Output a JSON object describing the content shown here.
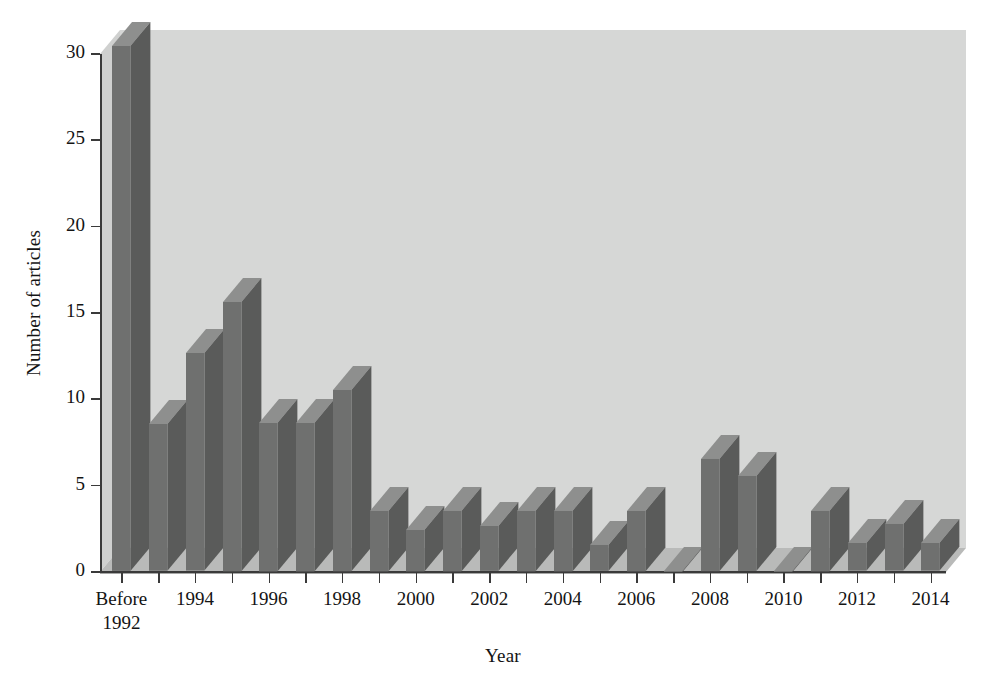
{
  "chart_data": {
    "type": "bar",
    "title": "",
    "xlabel": "Year",
    "ylabel": "Number of articles",
    "ylim": [
      0,
      30
    ],
    "yticks": [
      0,
      5,
      10,
      15,
      20,
      25,
      30
    ],
    "ytick_labels": [
      "0",
      "5",
      "10",
      "15",
      "20",
      "25",
      "30"
    ],
    "grid": false,
    "legend": "none",
    "style": "3d-bar",
    "categories": [
      "Before 1992",
      "1993",
      "1994",
      "1995",
      "1996",
      "1997",
      "1998",
      "1999",
      "2000",
      "2001",
      "2002",
      "2003",
      "2004",
      "2005",
      "2006",
      "2007",
      "2008",
      "2009",
      "2010",
      "2011",
      "2012",
      "2013",
      "2014"
    ],
    "xtick_labels": [
      "Before\n1992",
      "",
      "1994",
      "",
      "1996",
      "",
      "1998",
      "",
      "2000",
      "",
      "2002",
      "",
      "2004",
      "",
      "2006",
      "",
      "2008",
      "",
      "2010",
      "",
      "2012",
      "",
      "2014"
    ],
    "values": [
      31,
      8.5,
      12.6,
      15.6,
      8.6,
      8.6,
      10.5,
      3.5,
      2.4,
      3.5,
      2.6,
      3.5,
      3.5,
      1.5,
      3.5,
      0,
      6.5,
      5.5,
      0,
      3.5,
      1.6,
      2.7,
      1.6
    ]
  },
  "colors": {
    "bar_front": "#6f706f",
    "bar_top": "#8e8f8e",
    "bar_side": "#5a5b5a",
    "plot_wall": "#d6d7d6",
    "plot_floor": "#b9bab9",
    "plot_floor_edge": "#a6a7a6",
    "axis": "#3a3a3a",
    "text": "#141414",
    "background": "#ffffff"
  },
  "axis_titles": {
    "x": "Year",
    "y": "Number of articles"
  },
  "x_labels_rendered": [
    {
      "index": 0,
      "line1": "Before",
      "line2": "1992"
    },
    {
      "index": 2,
      "line1": "1994",
      "line2": ""
    },
    {
      "index": 4,
      "line1": "1996",
      "line2": ""
    },
    {
      "index": 6,
      "line1": "1998",
      "line2": ""
    },
    {
      "index": 8,
      "line1": "2000",
      "line2": ""
    },
    {
      "index": 10,
      "line1": "2002",
      "line2": ""
    },
    {
      "index": 12,
      "line1": "2004",
      "line2": ""
    },
    {
      "index": 14,
      "line1": "2006",
      "line2": ""
    },
    {
      "index": 16,
      "line1": "2008",
      "line2": ""
    },
    {
      "index": 18,
      "line1": "2010",
      "line2": ""
    },
    {
      "index": 20,
      "line1": "2012",
      "line2": ""
    },
    {
      "index": 22,
      "line1": "2014",
      "line2": ""
    }
  ]
}
